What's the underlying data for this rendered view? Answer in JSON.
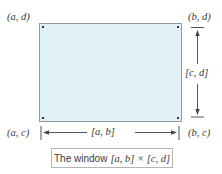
{
  "diagram": {
    "title": "The window [a, b] × [c, d]",
    "corners": {
      "top_left": "(a, d)",
      "top_right": "(b, d)",
      "bottom_left": "(a, c)",
      "bottom_right": "(b, c)"
    },
    "intervals": {
      "horizontal": "[a, b]",
      "vertical": "[c, d]"
    },
    "caption": {
      "prefix": "The window",
      "math": "[a, b] × [c, d]"
    },
    "colors": {
      "window_fill": "#e2f3f8",
      "window_border": "#8a9a9f",
      "arrow": "#444444",
      "caption_border": "#b5b5b5",
      "text": "#3a3a3a"
    }
  }
}
